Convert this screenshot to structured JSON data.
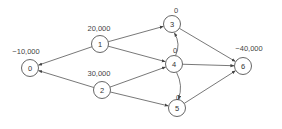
{
  "diagram": {
    "type": "network-flow",
    "colors": {
      "stroke": "#555555",
      "text": "#333333",
      "background": "#ffffff"
    },
    "nodes": [
      {
        "id": "0",
        "label": "0",
        "supply": "−10,000"
      },
      {
        "id": "1",
        "label": "1",
        "supply": "20,000"
      },
      {
        "id": "2",
        "label": "2",
        "supply": "30,000"
      },
      {
        "id": "3",
        "label": "3",
        "supply": "0"
      },
      {
        "id": "4",
        "label": "4",
        "supply": "0"
      },
      {
        "id": "5",
        "label": "5",
        "supply": "0"
      },
      {
        "id": "6",
        "label": "6",
        "supply": "−40,000"
      }
    ],
    "edges": [
      {
        "from": "1",
        "to": "0"
      },
      {
        "from": "2",
        "to": "0"
      },
      {
        "from": "1",
        "to": "3"
      },
      {
        "from": "1",
        "to": "4"
      },
      {
        "from": "2",
        "to": "4"
      },
      {
        "from": "2",
        "to": "5"
      },
      {
        "from": "4",
        "to": "3",
        "curved": true
      },
      {
        "from": "4",
        "to": "5",
        "curved": true
      },
      {
        "from": "3",
        "to": "6"
      },
      {
        "from": "4",
        "to": "6"
      },
      {
        "from": "5",
        "to": "6"
      }
    ]
  }
}
